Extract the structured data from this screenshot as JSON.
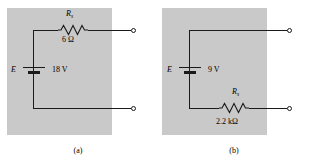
{
  "figure": {
    "panels": [
      {
        "id": "a",
        "caption": "(a)",
        "source_symbol": "E",
        "source_value": "18 V",
        "resistor_symbol": "R",
        "resistor_subscript": "s",
        "resistor_value": "6 Ω",
        "resistor_position": "top"
      },
      {
        "id": "b",
        "caption": "(b)",
        "source_symbol": "E",
        "source_value": "9 V",
        "resistor_symbol": "R",
        "resistor_subscript": "s",
        "resistor_value": "2.2 kΩ",
        "resistor_position": "bottom"
      }
    ]
  },
  "colors": {
    "panel_background": "#c9c9c9",
    "wire": "#1a1a1a",
    "page_background": "#ffffff",
    "text": "#000000"
  }
}
